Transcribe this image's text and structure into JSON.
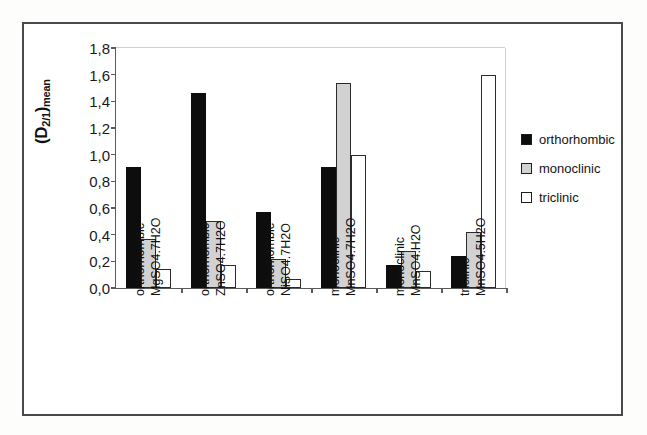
{
  "chart_data": {
    "type": "bar",
    "title": "",
    "xlabel": "",
    "ylabel": "(D2/1)mean",
    "ylim": [
      0.0,
      1.8
    ],
    "ytick_labels": [
      "1,8",
      "1,6",
      "1,4",
      "1,2",
      "1,0",
      "0,8",
      "0,6",
      "0,4",
      "0,2",
      "0,0"
    ],
    "ytick_values": [
      1.8,
      1.6,
      1.4,
      1.2,
      1.0,
      0.8,
      0.6,
      0.4,
      0.2,
      0.0
    ],
    "grid": false,
    "legend_position": "right",
    "categories": [
      {
        "system": "orthorhombic",
        "compound": "MgSO4.7H2O"
      },
      {
        "system": "orthorhombic",
        "compound": "ZnSO4.7H2O"
      },
      {
        "system": "orthorhombic",
        "compound": "NiSO4.7H2O"
      },
      {
        "system": "monoclinic",
        "compound": "MnSO4.7H2O"
      },
      {
        "system": "monoclinic",
        "compound": "MnSO4.H2O"
      },
      {
        "system": "triclinic",
        "compound": "MnSO4.5H2O"
      }
    ],
    "series": [
      {
        "name": "orthorhombic",
        "color": "#0d0d0d",
        "values": [
          0.91,
          1.46,
          0.57,
          0.91,
          0.17,
          0.24
        ]
      },
      {
        "name": "monoclinic",
        "color": "#d2d2d2",
        "values": [
          0.37,
          0.5,
          0.22,
          1.54,
          0.28,
          0.42
        ]
      },
      {
        "name": "triclinic",
        "color": "#ffffff",
        "values": [
          0.14,
          0.17,
          0.07,
          1.0,
          0.13,
          1.6
        ]
      }
    ]
  },
  "y_axis": {
    "title_main": "(D",
    "title_sub": "2/1",
    "title_close": ")",
    "title_mean": "mean"
  },
  "legend": {
    "items": [
      {
        "label": "orthorhombic",
        "swatch": "orthorhombic"
      },
      {
        "label": "monoclinic",
        "swatch": "monoclinic"
      },
      {
        "label": "triclinic",
        "swatch": "triclinic"
      }
    ]
  }
}
